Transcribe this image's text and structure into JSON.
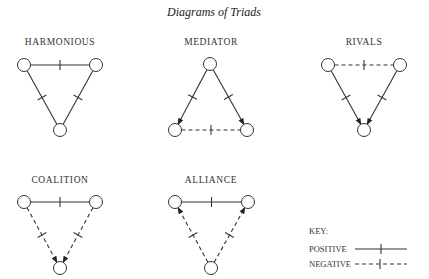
{
  "title": "Diagrams of Triads",
  "triads": [
    {
      "name": "HARMONIOUS",
      "edges": [
        {
          "from": "left",
          "to": "right",
          "sign": "positive",
          "arrow": false
        },
        {
          "from": "left",
          "to": "bottom",
          "sign": "positive",
          "arrow": false
        },
        {
          "from": "right",
          "to": "bottom",
          "sign": "positive",
          "arrow": false
        }
      ]
    },
    {
      "name": "MEDIATOR",
      "edges": [
        {
          "from": "top",
          "to": "left",
          "sign": "positive",
          "arrow": true
        },
        {
          "from": "top",
          "to": "right",
          "sign": "positive",
          "arrow": true
        },
        {
          "from": "left",
          "to": "right",
          "sign": "negative",
          "arrow": false
        }
      ]
    },
    {
      "name": "RIVALS",
      "edges": [
        {
          "from": "left",
          "to": "right",
          "sign": "negative",
          "arrow": false
        },
        {
          "from": "left",
          "to": "bottom",
          "sign": "positive",
          "arrow": true
        },
        {
          "from": "right",
          "to": "bottom",
          "sign": "positive",
          "arrow": true
        }
      ]
    },
    {
      "name": "COALITION",
      "edges": [
        {
          "from": "left",
          "to": "right",
          "sign": "positive",
          "arrow": false
        },
        {
          "from": "left",
          "to": "bottom",
          "sign": "negative",
          "arrow": true
        },
        {
          "from": "right",
          "to": "bottom",
          "sign": "negative",
          "arrow": true
        }
      ]
    },
    {
      "name": "ALLIANCE",
      "edges": [
        {
          "from": "left",
          "to": "right",
          "sign": "positive",
          "arrow": false
        },
        {
          "from": "bottom",
          "to": "left",
          "sign": "negative",
          "arrow": true
        },
        {
          "from": "bottom",
          "to": "right",
          "sign": "negative",
          "arrow": true
        }
      ]
    }
  ],
  "key": {
    "heading": "KEY:",
    "positive": "POSITIVE",
    "negative": "NEGATIVE"
  }
}
